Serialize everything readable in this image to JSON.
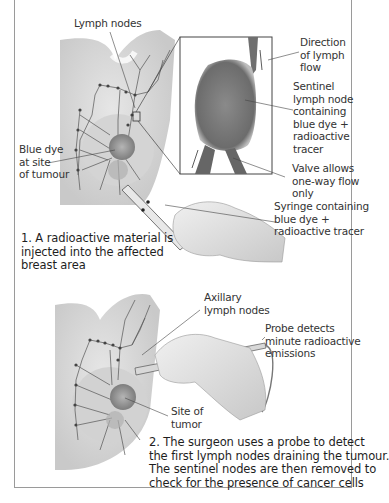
{
  "figure": {
    "panel1": {
      "labels": {
        "lymph_nodes": [
          "Lymph nodes"
        ],
        "direction_flow": [
          "Direction",
          "of lymph",
          "flow"
        ],
        "sentinel_node": [
          "Sentinel",
          "lymph node",
          "containing",
          "blue dye +",
          "radioactive",
          "tracer"
        ],
        "blue_dye": [
          "Blue dye",
          "at site",
          "of tumour"
        ],
        "valve": [
          "Valve allows",
          "one-way flow",
          "only"
        ],
        "syringe": [
          "Syringe containing",
          "blue dye +",
          "radioactive tracer"
        ]
      },
      "caption": [
        "1. A radioactive material is",
        "injected into the affected",
        "breast area"
      ]
    },
    "panel2": {
      "labels": {
        "axillary": [
          "Axillary",
          "lymph nodes"
        ],
        "probe": [
          "Probe detects",
          "minute radioactive",
          "emissions"
        ],
        "site": [
          "Site of",
          "tumor"
        ]
      },
      "caption": [
        "2. The surgeon uses a probe to detect",
        "the first lymph nodes draining the tumour.",
        "The sentinel nodes are then removed to",
        "check for the presence of cancer cells"
      ]
    }
  }
}
